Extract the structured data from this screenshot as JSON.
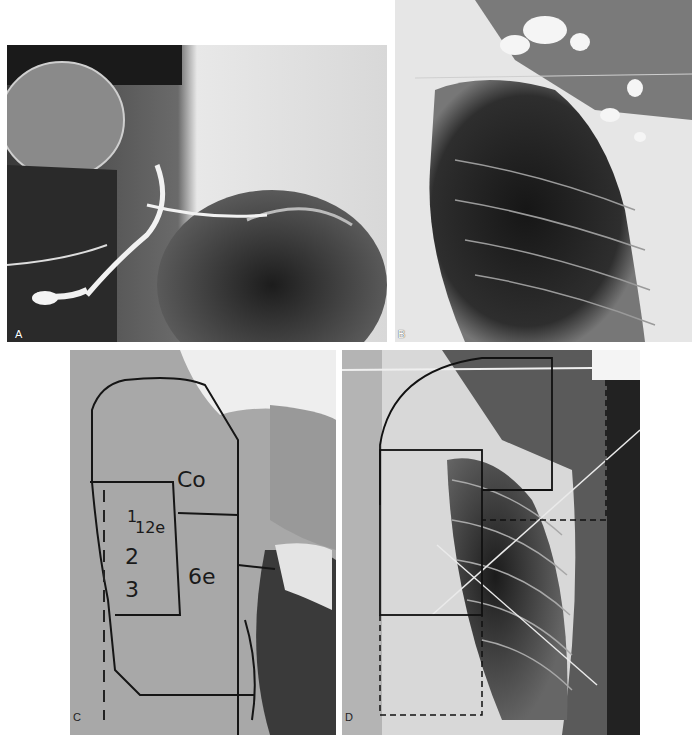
{
  "figure": {
    "panels": [
      {
        "id": "A",
        "label": "A",
        "description": "Lymphangiogram radiograph of shoulder/axilla with contrast-filled lymphatics"
      },
      {
        "id": "B",
        "label": "B",
        "description": "Chest radiograph of upper thorax with contrast-filled nodes"
      },
      {
        "id": "C",
        "label": "C",
        "description": "Clinical photograph of chest wall with marked treatment fields",
        "field_marks": {
          "co": "Co",
          "num1": "1",
          "e12": "12e",
          "num2": "2",
          "num3": "3",
          "e6": "6e"
        }
      },
      {
        "id": "D",
        "label": "D",
        "description": "Chest radiograph with overlaid treatment field outlines"
      }
    ],
    "colors": {
      "background": "#ffffff",
      "ink": "#111111",
      "skin": "#a9a9a9",
      "film_dark": "#1e1e1e",
      "film_light": "#eeeeee"
    }
  }
}
